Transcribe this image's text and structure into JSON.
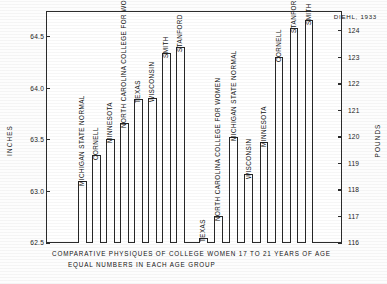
{
  "attribution": "DIEHL, 1933",
  "caption": {
    "line1": "COMPARATIVE PHYSIQUES OF COLLEGE WOMEN 17 TO 21 YEARS OF AGE",
    "line2": "EQUAL NUMBERS IN EACH AGE GROUP"
  },
  "axes": {
    "left_title": "INCHES",
    "right_title": "POUNDS",
    "left_ticks": [
      "64.5",
      "64.0",
      "63.5",
      "63.0",
      "62.5"
    ],
    "right_ticks": [
      "124",
      "123",
      "122",
      "121",
      "120",
      "119",
      "118",
      "117",
      "116"
    ]
  },
  "colors": {
    "ink": "#262626",
    "paper": "#ffffff",
    "frame": "#2b2b2b"
  },
  "chart_data": {
    "type": "bar",
    "title": "COMPARATIVE PHYSIQUES OF COLLEGE WOMEN 17 TO 21 YEARS OF AGE",
    "subtitle": "EQUAL NUMBERS IN EACH AGE GROUP",
    "annotation": "DIEHL, 1933",
    "grid": false,
    "legend": false,
    "panels": [
      {
        "name": "height",
        "ylabel": "INCHES",
        "axis_side": "left",
        "ylim": [
          62.5,
          64.75
        ],
        "ticks": [
          62.5,
          63.0,
          63.5,
          64.0,
          64.5
        ],
        "categories": [
          "MICHIGAN STATE NORMAL",
          "CORNELL",
          "MINNESOTA",
          "NORTH CAROLINA COLLEGE FOR WOMEN",
          "TEXAS",
          "WISCONSIN",
          "SMITH",
          "STANFORD"
        ],
        "values": [
          63.1,
          63.35,
          63.51,
          63.66,
          63.9,
          63.91,
          64.34,
          64.4
        ]
      },
      {
        "name": "weight",
        "ylabel": "POUNDS",
        "axis_side": "right",
        "ylim": [
          116,
          124.75
        ],
        "ticks": [
          116,
          117,
          118,
          119,
          120,
          121,
          122,
          123,
          124
        ],
        "categories": [
          "TEXAS",
          "NORTH CAROLINA COLLEGE FOR WOMEN",
          "MICHIGAN STATE NORMAL",
          "WISCONSIN",
          "MINNESOTA",
          "CORNELL",
          "STANFORD",
          "SMITH"
        ],
        "values": [
          116.2,
          117.0,
          120.0,
          118.6,
          119.8,
          123.0,
          124.1,
          124.4
        ]
      }
    ]
  }
}
